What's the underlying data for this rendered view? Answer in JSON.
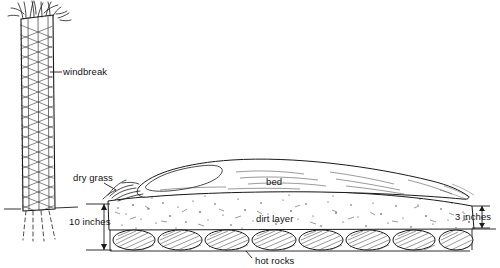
{
  "diagram": {
    "labels": {
      "windbreak": "windbreak",
      "dry_grass": "dry grass",
      "bed": "bed",
      "dirt_layer": "dirt layer",
      "hot_rocks": "hot rocks",
      "depth_left": "10 inches",
      "depth_right": "3 inches"
    },
    "colors": {
      "ink": "#1a1a1a",
      "paper": "#ffffff",
      "shade": "#7a7a7a"
    },
    "measurements": [
      {
        "name": "bed-depth-left",
        "value": "10 inches"
      },
      {
        "name": "bed-depth-right",
        "value": "3 inches"
      }
    ]
  }
}
